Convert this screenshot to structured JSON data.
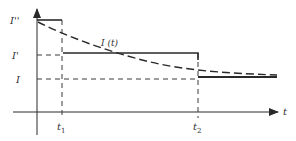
{
  "diagram": {
    "type": "current-time step diagram",
    "colors": {
      "background": "#ffffff",
      "ink": "#2a2a2a",
      "dashed": "#3a3a3a"
    },
    "labels": {
      "y_I_double_prime": "I''",
      "y_I_prime": "I'",
      "y_I": "I",
      "curve": "I (t)",
      "x_axis": "t",
      "t1": "t",
      "t1_sub": "1",
      "t2": "t",
      "t2_sub": "2"
    },
    "levels": {
      "I_double_prime_y": 20,
      "I_prime_y": 55,
      "I_y": 79
    },
    "times": {
      "t1_x": 62,
      "t2_x": 198
    }
  }
}
